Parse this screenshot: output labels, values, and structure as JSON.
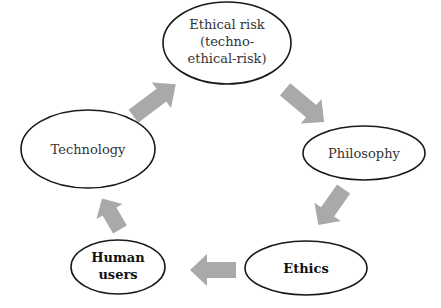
{
  "diagram": {
    "type": "cycle",
    "colors": {
      "arrow": "#a9a9a9",
      "node_stroke": "#1a1a1a",
      "node_fill": "#ffffff",
      "text": "#333333"
    },
    "nodes": [
      {
        "id": "ethical-risk",
        "lines": [
          "Ethical risk",
          "(techno-",
          "ethical-risk)"
        ],
        "bold": false
      },
      {
        "id": "philosophy",
        "lines": [
          "Philosophy"
        ],
        "bold": false
      },
      {
        "id": "ethics",
        "lines": [
          "Ethics"
        ],
        "bold": true
      },
      {
        "id": "human-users",
        "lines": [
          "Human",
          "users"
        ],
        "bold": true
      },
      {
        "id": "technology",
        "lines": [
          "Technology"
        ],
        "bold": false
      }
    ],
    "edges": [
      {
        "from": "technology",
        "to": "ethical-risk"
      },
      {
        "from": "ethical-risk",
        "to": "philosophy"
      },
      {
        "from": "philosophy",
        "to": "ethics"
      },
      {
        "from": "ethics",
        "to": "human-users"
      },
      {
        "from": "human-users",
        "to": "technology"
      }
    ]
  }
}
